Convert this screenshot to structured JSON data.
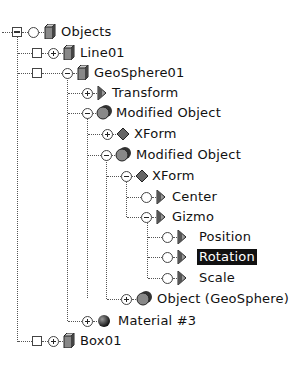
{
  "tree": {
    "nodes": [
      {
        "label": "Objects",
        "icon": "cube-icon",
        "depth": 0
      },
      {
        "label": "Line01",
        "icon": "cube-icon",
        "depth": 1
      },
      {
        "label": "GeoSphere01",
        "icon": "cube-icon",
        "depth": 1
      },
      {
        "label": "Transform",
        "icon": "controller-icon",
        "depth": 2
      },
      {
        "label": "Modified Object",
        "icon": "sphere-stack-icon",
        "depth": 2
      },
      {
        "label": "XForm",
        "icon": "modifier-diamond-icon",
        "depth": 3
      },
      {
        "label": "Modified Object",
        "icon": "sphere-stack-icon",
        "depth": 3
      },
      {
        "label": "XForm",
        "icon": "modifier-diamond-icon",
        "depth": 4
      },
      {
        "label": "Center",
        "icon": "controller-icon",
        "depth": 5
      },
      {
        "label": "Gizmo",
        "icon": "controller-icon",
        "depth": 5
      },
      {
        "label": "Position",
        "icon": "controller-icon",
        "depth": 6
      },
      {
        "label": "Rotation",
        "icon": "controller-icon",
        "depth": 6,
        "selected": true
      },
      {
        "label": "Scale",
        "icon": "controller-icon",
        "depth": 6
      },
      {
        "label": "Object (GeoSphere)",
        "icon": "sphere-stack-icon",
        "depth": 4
      },
      {
        "label": "Material #3",
        "icon": "material-sphere-icon",
        "depth": 2
      },
      {
        "label": "Box01",
        "icon": "cube-icon",
        "depth": 1
      }
    ]
  }
}
